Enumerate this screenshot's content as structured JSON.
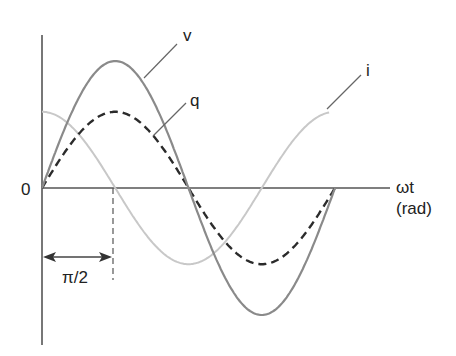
{
  "diagram": {
    "title": "",
    "labels": {
      "v": "v",
      "q": "q",
      "i": "i",
      "origin": "0",
      "x_axis_line1": "ωt",
      "x_axis_line2": "(rad)",
      "phase_shift": "π/2"
    },
    "colors": {
      "axis": "#555555",
      "v": "#8a8a8a",
      "q": "#2b2b2b",
      "i": "#c8c8c8"
    }
  },
  "chart_data": {
    "type": "line",
    "title": "",
    "xlabel": "ωt (rad)",
    "ylabel": "",
    "x_range_rad": [
      0,
      6.283
    ],
    "series": [
      {
        "name": "v",
        "function": "sin(ωt)",
        "amplitude": 1.0,
        "style": "solid, medium gray"
      },
      {
        "name": "q",
        "function": "0.6·sin(ωt)",
        "amplitude": 0.6,
        "style": "dashed, dark"
      },
      {
        "name": "i",
        "function": "0.6·cos(ωt)",
        "amplitude": 0.6,
        "style": "solid, light gray"
      }
    ],
    "annotations": [
      {
        "text": "π/2",
        "type": "double-arrow",
        "from": 0,
        "to": 1.5708
      },
      {
        "text": "0",
        "type": "origin-label"
      }
    ],
    "grid": false,
    "legend": "inline labels with leader lines"
  }
}
